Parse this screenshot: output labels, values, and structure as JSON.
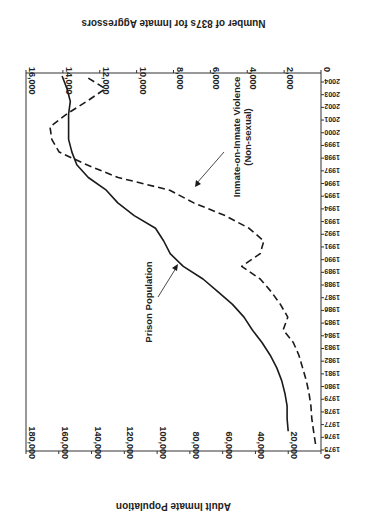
{
  "chart_data": {
    "type": "line",
    "orientation": "rotated 90 degrees (year axis vertical on right, values increasing leftward)",
    "title": "",
    "xlabel": "Year",
    "categories": [
      1975,
      1976,
      1977,
      1978,
      1979,
      1980,
      1981,
      1982,
      1983,
      1984,
      1985,
      1986,
      1987,
      1988,
      1989,
      1990,
      1991,
      1992,
      1993,
      1994,
      1995,
      1996,
      1997,
      1998,
      1999,
      2000,
      2001,
      2002,
      2003,
      2004
    ],
    "series": [
      {
        "name": "Prison Population",
        "axis": "Adult Inmate Population",
        "style": "solid",
        "values": [
          null,
          20000,
          20700,
          20700,
          22000,
          24000,
          27000,
          31000,
          36000,
          42000,
          47000,
          54000,
          63000,
          72000,
          84000,
          92000,
          96000,
          101000,
          114000,
          124000,
          131000,
          142000,
          149000,
          152000,
          154000,
          154000,
          154000,
          153000,
          155000,
          158000
        ]
      },
      {
        "name": "Inmate-on-Inmate Violence (Non-sexual)",
        "axis": "Number of 837s for Inmate Aggressors",
        "style": "dashed",
        "values": [
          300,
          400,
          500,
          550,
          650,
          800,
          1000,
          1200,
          1500,
          2050,
          1800,
          2200,
          2700,
          3300,
          4300,
          3300,
          3100,
          3900,
          5200,
          6900,
          8200,
          11000,
          12700,
          14200,
          14600,
          14700,
          13800,
          12700,
          11700,
          12800
        ]
      }
    ],
    "primary_axis": {
      "label": "Adult Inmate Population",
      "range": [
        0,
        180000
      ],
      "ticks": [
        "0",
        "20,000",
        "40,000",
        "60,000",
        "80,000",
        "100,000",
        "120,000",
        "140,000",
        "160,000",
        "180,000"
      ]
    },
    "secondary_axis": {
      "label": "Number of 837s for Inmate Aggressors",
      "range": [
        0,
        16000
      ],
      "ticks": [
        "0",
        "2,000",
        "4,000",
        "6,000",
        "8,000",
        "10,000",
        "12,000",
        "14,000",
        "16,000"
      ]
    },
    "year_ticks": [
      "1975",
      "1976",
      "1977",
      "1978",
      "1979",
      "1980",
      "1981",
      "1982",
      "1983",
      "1984",
      "1985",
      "1986",
      "1987",
      "1988",
      "1989",
      "1990",
      "1991",
      "1992",
      "1993",
      "1994",
      "1995",
      "1996",
      "1997",
      "1998",
      "1999",
      "2000",
      "2001",
      "2002",
      "2003",
      "2004"
    ],
    "annotations": [
      {
        "text": "Prison Population",
        "series": 0
      },
      {
        "text_line1": "Inmate-on-Inmate Violence",
        "text_line2": "(Non-sexual)",
        "series": 1
      }
    ],
    "grid": false,
    "legend": "none (inline arrow annotations)"
  },
  "colors": {
    "line": "#1a1a1a",
    "axis": "#333333",
    "background": "#ffffff"
  }
}
